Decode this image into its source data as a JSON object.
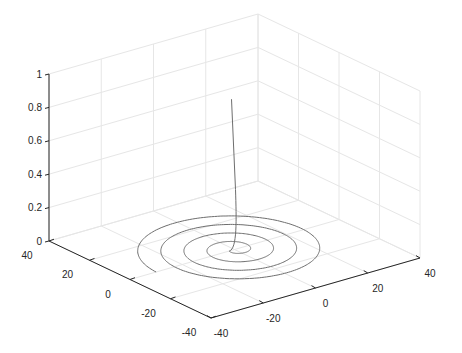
{
  "chart_data": {
    "type": "line3d",
    "title": "",
    "xlabel": "",
    "ylabel": "",
    "zlabel": "",
    "xlim": [
      -40,
      40
    ],
    "ylim": [
      -40,
      40
    ],
    "zlim": [
      0,
      1
    ],
    "x_ticks": [
      "-40",
      "-20",
      "0",
      "20",
      "40"
    ],
    "y_ticks": [
      "-40",
      "-20",
      "0",
      "20",
      "40"
    ],
    "z_ticks": [
      "0",
      "0.2",
      "0.4",
      "0.6",
      "0.8",
      "1"
    ],
    "grid": true,
    "series": [
      {
        "name": "spiral",
        "description": "Spiral in the z=0 plane with about 4 turns, radius growing to ~30, rising vertically near the center to z~0.9",
        "color": "#6e6e6e",
        "max_radius": 30,
        "turns": 4,
        "z_top": 0.9
      }
    ]
  }
}
